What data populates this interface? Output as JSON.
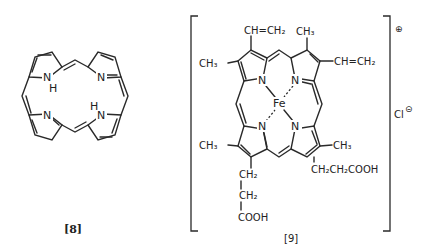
{
  "figure": {
    "compound_8": {
      "caption": "[8]",
      "name": "porphine",
      "atoms": {
        "n_top_left": "N",
        "h_top_left": "H",
        "n_top_right": "N",
        "n_bottom_left": "N",
        "n_bottom_right": "N",
        "h_bottom_right": "H"
      }
    },
    "compound_9": {
      "caption": "[9]",
      "name": "hemin",
      "center_metal": "Fe",
      "nitrogens": [
        "N",
        "N",
        "N",
        "N"
      ],
      "substituents": {
        "top_left_top": "CH=CH₂",
        "top_left_left": "CH₃",
        "top_right_top": "CH₃",
        "top_right_right": "CH=CH₂",
        "bottom_left_left": "CH₃",
        "bottom_left_chain": [
          "CH₂",
          "CH₂",
          "COOH"
        ],
        "bottom_right_right": "CH₃",
        "bottom_right_chain": "CH₂CH₂COOH"
      },
      "charge": "⊕",
      "counter_ion": "Cl",
      "counter_ion_charge": "⊝"
    }
  }
}
